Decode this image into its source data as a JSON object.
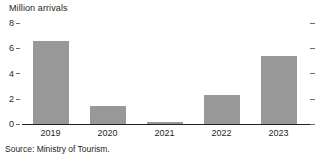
{
  "chart_data": {
    "type": "bar",
    "title": "Million arrivals",
    "xlabel": "",
    "ylabel": "",
    "categories": [
      "2019",
      "2020",
      "2021",
      "2022",
      "2023"
    ],
    "values": [
      6.6,
      1.4,
      0.15,
      2.3,
      5.4
    ],
    "yticks": [
      0,
      2,
      4,
      6,
      8
    ],
    "ytick_labels": [
      "0",
      "2",
      "4",
      "6",
      "8"
    ],
    "ylim": [
      0,
      8
    ],
    "grid": false,
    "legend": null,
    "legend_position": "none",
    "bar_color": "#989898",
    "axis_color": "#231f20",
    "tick_color": "#6d6e71",
    "background": "#ffffff",
    "annotations": [],
    "source": "Source: Ministry of Tourism."
  }
}
